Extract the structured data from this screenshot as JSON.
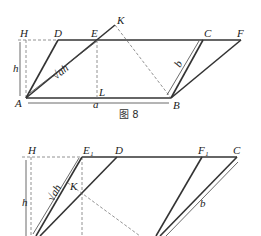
{
  "figure8": {
    "caption": "图 8",
    "points": {
      "H": "H",
      "D": "D",
      "E": "E",
      "K": "K",
      "C": "C",
      "F": "F",
      "A": "A",
      "L": "L",
      "B": "B"
    },
    "measures": {
      "h": "h",
      "sqrt_ah": "√ah",
      "a": "a",
      "b": "b"
    }
  },
  "figure9": {
    "points": {
      "H": "H",
      "E1": "E₁",
      "D": "D",
      "F1": "F₁",
      "C": "C",
      "K": "K"
    },
    "measures": {
      "h": "h",
      "sqrt_ah": "√ah",
      "b": "b"
    }
  },
  "colors": {
    "line": "#333333",
    "dash": "#777777",
    "background": "#ffffff"
  }
}
